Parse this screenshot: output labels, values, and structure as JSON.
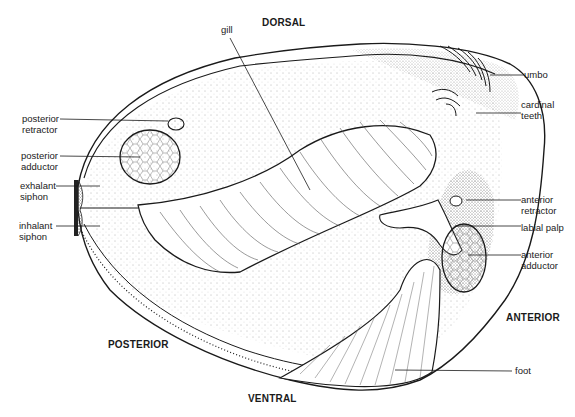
{
  "diagram": {
    "ink_color": "#1a1a1a",
    "background": "#ffffff",
    "orientation": {
      "dorsal": "DORSAL",
      "ventral": "VENTRAL",
      "posterior": "POSTERIOR",
      "anterior": "ANTERIOR"
    },
    "labels": {
      "gill": "gill",
      "umbo": "umbo",
      "cardinal_teeth": "cardinal\nteeth",
      "posterior_retractor": "posterior\nretractor",
      "posterior_adductor": "posterior\nadductor",
      "exhalant_siphon": "exhalant\nsiphon",
      "inhalant_siphon": "inhalant\nsiphon",
      "anterior_retractor": "anterior\nretractor",
      "labial_palp": "labial palp",
      "anterior_adductor": "anterior\nadductor",
      "foot": "foot"
    }
  }
}
